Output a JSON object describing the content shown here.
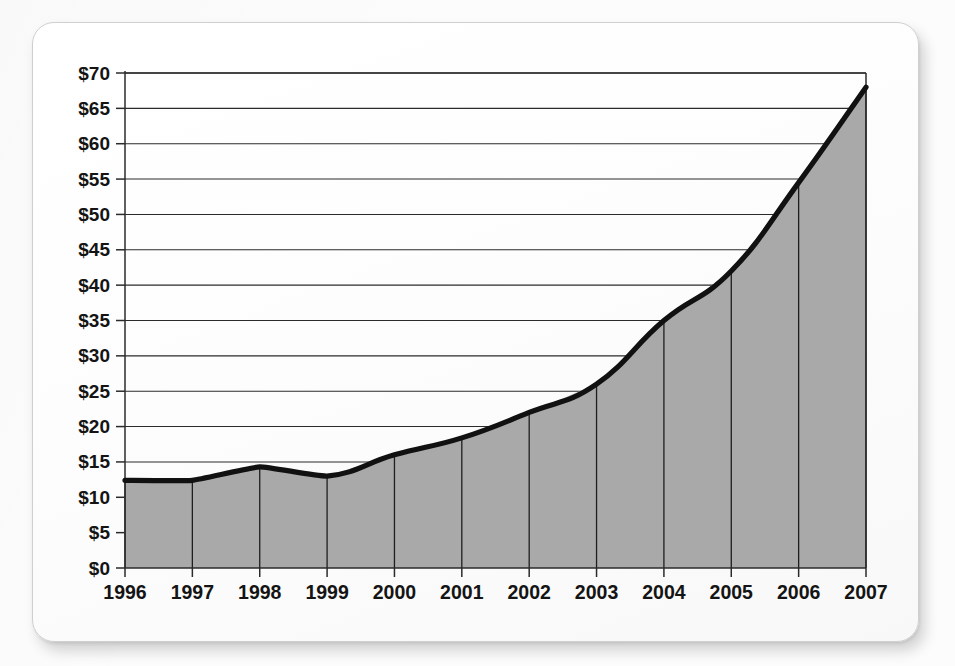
{
  "chart_data": {
    "type": "area",
    "title": "",
    "subtitle": "",
    "xlabel": "",
    "ylabel": "",
    "categories": [
      "1996",
      "1997",
      "1998",
      "1999",
      "2000",
      "2001",
      "2002",
      "2003",
      "2004",
      "2005",
      "2006",
      "2007"
    ],
    "values": [
      12.4,
      12.4,
      14.3,
      13.0,
      16.0,
      18.4,
      22.0,
      26.0,
      35.0,
      42.0,
      54.5,
      68.0
    ],
    "series": [
      {
        "name": "",
        "values": [
          12.4,
          12.4,
          14.3,
          13.0,
          16.0,
          18.4,
          22.0,
          26.0,
          35.0,
          42.0,
          54.5,
          68.0
        ]
      }
    ],
    "ylim": [
      0,
      70
    ],
    "yticks": [
      0,
      5,
      10,
      15,
      20,
      25,
      30,
      35,
      40,
      45,
      50,
      55,
      60,
      65,
      70
    ],
    "ytick_labels": [
      "$0",
      "$5",
      "$10",
      "$15",
      "$20",
      "$25",
      "$30",
      "$35",
      "$40",
      "$45",
      "$50",
      "$55",
      "$60",
      "$65",
      "$70"
    ],
    "xtick_labels": [
      "1996",
      "1997",
      "1998",
      "1999",
      "2000",
      "2001",
      "2002",
      "2003",
      "2004",
      "2005",
      "2006",
      "2007"
    ],
    "grid": true,
    "grid_axis": "y",
    "legend": false,
    "legend_position": "none",
    "area_fill_color": "#a9a9a9",
    "line_color": "#111111",
    "grid_color": "#2b2b2b",
    "axis_color": "#2b2b2b",
    "column_separators": true,
    "annotations": []
  },
  "card": {
    "background_color": "#ffffff",
    "border_color": "#cfcfcf"
  },
  "page": {
    "background_color": "#fbfbfb",
    "watermark_text": ""
  }
}
